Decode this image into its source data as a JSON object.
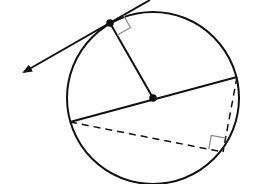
{
  "diagram": {
    "type": "circle-geometry",
    "colors": {
      "stroke": "#111111",
      "right_angle_marker": "#888888",
      "background": "#ffffff"
    },
    "circle": {
      "cx": 153,
      "cy": 98,
      "r": 86
    },
    "center_point": {
      "x": 153,
      "y": 98
    },
    "tangent_point": {
      "x": 110,
      "y": 23
    },
    "tangent_line": {
      "x1": 150,
      "y1": 0,
      "x2": 22,
      "y2": 73,
      "arrow_end": "x2"
    },
    "diameter": {
      "x1": 70,
      "y1": 122,
      "x2": 237,
      "y2": 77
    },
    "inscribed_vertex": {
      "x": 223,
      "y": 152
    },
    "labels": []
  }
}
